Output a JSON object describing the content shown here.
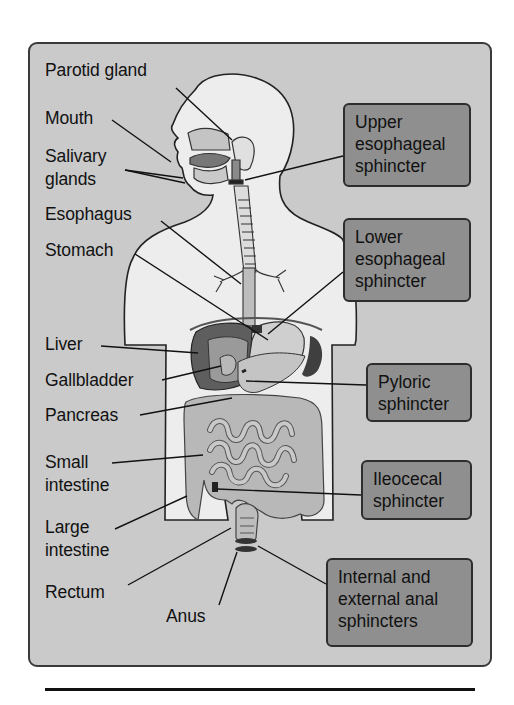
{
  "figure": {
    "type": "anatomical diagram",
    "colors": {
      "panel_background": "#cacaca",
      "panel_border": "#3a3a3a",
      "box_background": "#8f8f8f",
      "box_border": "#2d2d2d",
      "body_fill": "#ededed",
      "organ_fill": "#b5b5b5",
      "liver_fill": "#5e5e5e",
      "text": "#111111"
    }
  },
  "left_labels": {
    "parotid_gland": "Parotid gland",
    "mouth": "Mouth",
    "salivary_glands_line1": "Salivary",
    "salivary_glands_line2": "glands",
    "esophagus": "Esophagus",
    "stomach": "Stomach",
    "liver": "Liver",
    "gallbladder": "Gallbladder",
    "pancreas": "Pancreas",
    "small_intestine_line1": "Small",
    "small_intestine_line2": "intestine",
    "large_intestine_line1": "Large",
    "large_intestine_line2": "intestine",
    "rectum": "Rectum",
    "anus": "Anus"
  },
  "sphincter_boxes": [
    {
      "lines": [
        "Upper",
        "esophageal",
        "sphincter"
      ]
    },
    {
      "lines": [
        "Lower",
        "esophageal",
        "sphincter"
      ]
    },
    {
      "lines": [
        "Pyloric",
        "sphincter"
      ]
    },
    {
      "lines": [
        "Ileocecal",
        "sphincter"
      ]
    },
    {
      "lines": [
        "Internal and",
        "external anal",
        "sphincters"
      ]
    }
  ]
}
